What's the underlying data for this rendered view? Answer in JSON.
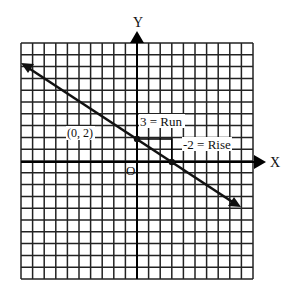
{
  "chart_data": {
    "type": "line",
    "title": "",
    "xlabel": "X",
    "ylabel": "Y",
    "origin_label": "O",
    "grid": true,
    "grid_cells": {
      "x": 20,
      "y": 20
    },
    "xlim": [
      -10,
      10
    ],
    "ylim": [
      -10,
      10
    ],
    "line": {
      "slope": -0.6667,
      "intercept": 2,
      "equation": "y = -2/3 x + 2",
      "arrow_both_ends": true,
      "x_range": [
        -9.9,
        8.9
      ]
    },
    "points": [
      {
        "x": 0,
        "y": 2,
        "label": "(0, 2)"
      },
      {
        "x": 3,
        "y": 0,
        "label": ""
      }
    ],
    "annotations": [
      {
        "text": "3 = Run",
        "x": 0.3,
        "y": 3.0
      },
      {
        "text": "-2 = Rise",
        "x": 4.0,
        "y": 1.4
      }
    ],
    "slope_triangle": {
      "from": [
        0,
        2
      ],
      "corner": [
        3,
        2
      ],
      "to": [
        3,
        0
      ]
    }
  },
  "labels": {
    "x_axis": "X",
    "y_axis": "Y",
    "origin": "O",
    "point_label": "(0, 2)",
    "run": "3 = Run",
    "rise": "-2 = Rise"
  },
  "colors": {
    "grid": "#222222",
    "axis": "#000000",
    "line": "#111111",
    "background": "#ffffff"
  }
}
